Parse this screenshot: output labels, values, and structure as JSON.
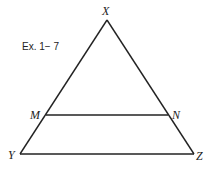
{
  "caption": "Ex. 1− 7",
  "figure": {
    "shape": "triangle",
    "vertices": {
      "X": {
        "label": "X",
        "x": 107,
        "y": 20
      },
      "Y": {
        "label": "Y",
        "x": 20,
        "y": 154
      },
      "Z": {
        "label": "Z",
        "x": 194,
        "y": 154
      }
    },
    "segment_points": {
      "M": {
        "label": "M",
        "x": 46,
        "y": 115
      },
      "N": {
        "label": "N",
        "x": 168,
        "y": 115
      }
    },
    "segments": [
      "XY",
      "XZ",
      "YZ",
      "MN"
    ],
    "stroke_color": "#222222"
  }
}
